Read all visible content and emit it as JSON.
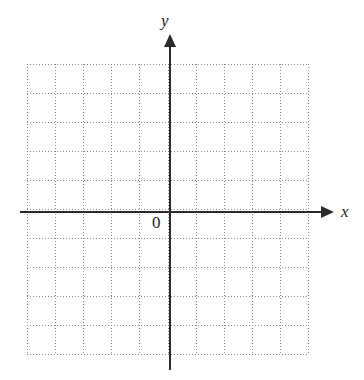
{
  "figure": {
    "kind": "blank-cartesian-coordinate-grid",
    "background_color": "#ffffff",
    "axis_color": "#2b2b2b",
    "grid_color": "#8e8e8e"
  },
  "labels": {
    "y_axis": "y",
    "x_axis": "x",
    "origin": "0"
  },
  "chart_data": {
    "type": "scatter",
    "title": "",
    "subtitle": "",
    "xlabel": "x",
    "ylabel": "y",
    "origin_label": "0",
    "series": [
      {
        "name": "",
        "x": [],
        "y": []
      }
    ],
    "x": [],
    "values": [],
    "categories": [],
    "xlim": [
      -5,
      5
    ],
    "ylim": [
      -5,
      5
    ],
    "xticks": [],
    "yticks": [],
    "xticklabels": [],
    "yticklabels": [],
    "grid": true,
    "grid_style": "dotted",
    "grid_cells_x": 10,
    "grid_cells_y": 10,
    "legend": false,
    "legend_position": "none",
    "annotations": []
  }
}
